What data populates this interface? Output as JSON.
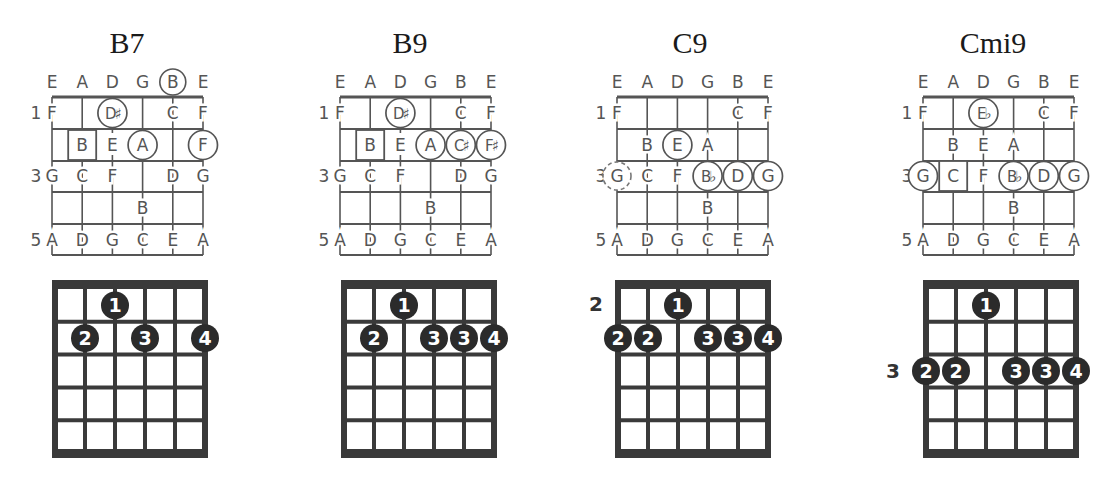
{
  "strings": [
    "E",
    "A",
    "D",
    "G",
    "B",
    "E"
  ],
  "fret_notes": {
    "1": [
      "F",
      "",
      "",
      "",
      "C",
      "F"
    ],
    "2": [
      "",
      "B",
      "E",
      "A",
      "",
      ""
    ],
    "3": [
      "G",
      "C",
      "F",
      "",
      "D",
      "G"
    ],
    "4": [
      "",
      "",
      "",
      "B",
      "",
      ""
    ],
    "5": [
      "A",
      "D",
      "G",
      "C",
      "E",
      "A"
    ]
  },
  "fret_numbers": [
    "1",
    "3",
    "5"
  ],
  "chords": [
    {
      "name": "B7",
      "open_circled": [
        4
      ],
      "notes": [
        {
          "fret": 1,
          "string": 2,
          "label": "D♯",
          "mark": "circle"
        },
        {
          "fret": 2,
          "string": 1,
          "label": "B",
          "mark": "square"
        },
        {
          "fret": 2,
          "string": 2,
          "label": "E",
          "mark": "none"
        },
        {
          "fret": 2,
          "string": 3,
          "label": "A",
          "mark": "circle"
        },
        {
          "fret": 2,
          "string": 5,
          "label": "F♯",
          "display": "F",
          "mark": "circle"
        }
      ],
      "fingering": {
        "position": "",
        "dots": [
          {
            "fret": 1,
            "string": 2,
            "finger": "1"
          },
          {
            "fret": 2,
            "string": 1,
            "finger": "2"
          },
          {
            "fret": 2,
            "string": 3,
            "finger": "3"
          },
          {
            "fret": 2,
            "string": 5,
            "finger": "4"
          }
        ]
      }
    },
    {
      "name": "B9",
      "open_circled": [],
      "notes": [
        {
          "fret": 1,
          "string": 2,
          "label": "D♯",
          "mark": "circle"
        },
        {
          "fret": 2,
          "string": 1,
          "label": "B",
          "mark": "square"
        },
        {
          "fret": 2,
          "string": 2,
          "label": "E",
          "mark": "none"
        },
        {
          "fret": 2,
          "string": 3,
          "label": "A",
          "mark": "circle"
        },
        {
          "fret": 2,
          "string": 4,
          "label": "C♯",
          "mark": "circle"
        },
        {
          "fret": 2,
          "string": 5,
          "label": "F♯",
          "mark": "circle"
        }
      ],
      "fingering": {
        "position": "",
        "dots": [
          {
            "fret": 1,
            "string": 2,
            "finger": "1"
          },
          {
            "fret": 2,
            "string": 1,
            "finger": "2"
          },
          {
            "fret": 2,
            "string": 3,
            "finger": "3"
          },
          {
            "fret": 2,
            "string": 4,
            "finger": "3"
          },
          {
            "fret": 2,
            "string": 5,
            "finger": "4"
          }
        ]
      }
    },
    {
      "name": "C9",
      "open_circled": [],
      "notes": [
        {
          "fret": 2,
          "string": 2,
          "label": "E",
          "mark": "circle"
        },
        {
          "fret": 3,
          "string": 0,
          "label": "G",
          "mark": "dashed"
        },
        {
          "fret": 3,
          "string": 3,
          "label": "B♭",
          "mark": "circle"
        },
        {
          "fret": 3,
          "string": 4,
          "label": "D",
          "mark": "circle"
        },
        {
          "fret": 3,
          "string": 5,
          "label": "G",
          "mark": "circle"
        }
      ],
      "fingering": {
        "position": "2",
        "dots": [
          {
            "fret": 1,
            "string": 2,
            "finger": "1"
          },
          {
            "fret": 2,
            "string": 0,
            "finger": "2"
          },
          {
            "fret": 2,
            "string": 1,
            "finger": "2"
          },
          {
            "fret": 2,
            "string": 3,
            "finger": "3"
          },
          {
            "fret": 2,
            "string": 4,
            "finger": "3"
          },
          {
            "fret": 2,
            "string": 5,
            "finger": "4"
          }
        ]
      }
    },
    {
      "name": "Cmi9",
      "open_circled": [],
      "notes": [
        {
          "fret": 1,
          "string": 2,
          "label": "E♭",
          "mark": "circle"
        },
        {
          "fret": 3,
          "string": 0,
          "label": "G",
          "mark": "circle"
        },
        {
          "fret": 3,
          "string": 1,
          "label": "C",
          "mark": "square"
        },
        {
          "fret": 3,
          "string": 3,
          "label": "B♭",
          "mark": "circle"
        },
        {
          "fret": 3,
          "string": 4,
          "label": "D",
          "mark": "circle"
        },
        {
          "fret": 3,
          "string": 5,
          "label": "G",
          "mark": "circle"
        }
      ],
      "fingering": {
        "position": "3",
        "dots": [
          {
            "fret": 1,
            "string": 2,
            "finger": "1"
          },
          {
            "fret": 3,
            "string": 0,
            "finger": "2"
          },
          {
            "fret": 3,
            "string": 1,
            "finger": "2"
          },
          {
            "fret": 3,
            "string": 3,
            "finger": "3"
          },
          {
            "fret": 3,
            "string": 4,
            "finger": "3"
          },
          {
            "fret": 3,
            "string": 5,
            "finger": "4"
          }
        ]
      }
    }
  ]
}
